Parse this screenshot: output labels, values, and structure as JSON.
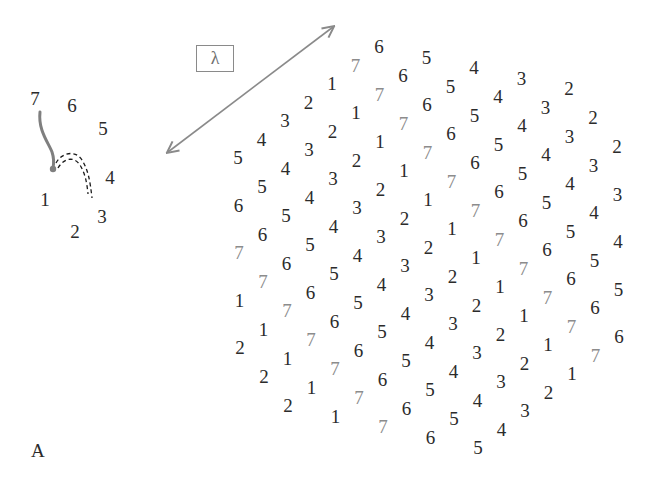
{
  "figure": {
    "panel_label": "A",
    "lambda_label": "λ",
    "colors": {
      "digit": "#2b2b2b",
      "digit_seven": "#8c8c8c",
      "arrow": "#8a8a8a",
      "trajectory": "#7f7f7f",
      "dashed_arc": "#1a1a1a"
    }
  },
  "small_cycle": {
    "digits": [
      {
        "value": "7",
        "x": 35,
        "y": 98
      },
      {
        "value": "6",
        "x": 72,
        "y": 105
      },
      {
        "value": "5",
        "x": 103,
        "y": 128
      },
      {
        "value": "4",
        "x": 110,
        "y": 177
      },
      {
        "value": "3",
        "x": 102,
        "y": 216
      },
      {
        "value": "2",
        "x": 75,
        "y": 231
      },
      {
        "value": "1",
        "x": 45,
        "y": 199
      }
    ]
  },
  "lattice": {
    "origin": [
      238,
      157
    ],
    "u": [
      23.5,
      -18.5
    ],
    "d": [
      24,
      29
    ],
    "rows": [
      {
        "b": 0,
        "a_start": 0,
        "values": [
          "5",
          "4",
          "3",
          "2",
          "1",
          "7",
          "6"
        ]
      },
      {
        "b": 1,
        "a_start": -1,
        "values": [
          "6",
          "5",
          "4",
          "3",
          "2",
          "1",
          "7",
          "6",
          "5"
        ]
      },
      {
        "b": 2,
        "a_start": -2,
        "values": [
          "7",
          "6",
          "5",
          "4",
          "3",
          "2",
          "1",
          "7",
          "6",
          "5",
          "4"
        ]
      },
      {
        "b": 3,
        "a_start": -3,
        "values": [
          "1",
          "7",
          "6",
          "5",
          "4",
          "3",
          "2",
          "1",
          "7",
          "6",
          "5",
          "4",
          "3"
        ]
      },
      {
        "b": 4,
        "a_start": -4,
        "values": [
          "2",
          "1",
          "7",
          "6",
          "5",
          "4",
          "3",
          "2",
          "1",
          "7",
          "6",
          "5",
          "4",
          "3",
          "2"
        ]
      },
      {
        "b": 5,
        "a_start": -4,
        "values": [
          "2",
          "1",
          "7",
          "6",
          "5",
          "4",
          "3",
          "2",
          "1",
          "7",
          "6",
          "5",
          "4",
          "3",
          "2"
        ]
      },
      {
        "b": 6,
        "a_start": -4,
        "values": [
          "2",
          "1",
          "7",
          "6",
          "5",
          "4",
          "3",
          "2",
          "1",
          "7",
          "6",
          "5",
          "4",
          "3",
          "2"
        ]
      },
      {
        "b": 7,
        "a_start": -3,
        "values": [
          "1",
          "7",
          "6",
          "5",
          "4",
          "3",
          "2",
          "1",
          "7",
          "6",
          "5",
          "4",
          "3"
        ]
      },
      {
        "b": 8,
        "a_start": -2,
        "values": [
          "7",
          "6",
          "5",
          "4",
          "3",
          "2",
          "1",
          "7",
          "6",
          "5",
          "4"
        ]
      },
      {
        "b": 9,
        "a_start": -1,
        "values": [
          "6",
          "5",
          "4",
          "3",
          "2",
          "1",
          "7",
          "6",
          "5"
        ]
      },
      {
        "b": 10,
        "a_start": 0,
        "values": [
          "5",
          "4",
          "3",
          "2",
          "1",
          "7",
          "6"
        ]
      }
    ]
  },
  "arrow": {
    "x1": 168,
    "y1": 152,
    "x2": 333,
    "y2": 27
  }
}
